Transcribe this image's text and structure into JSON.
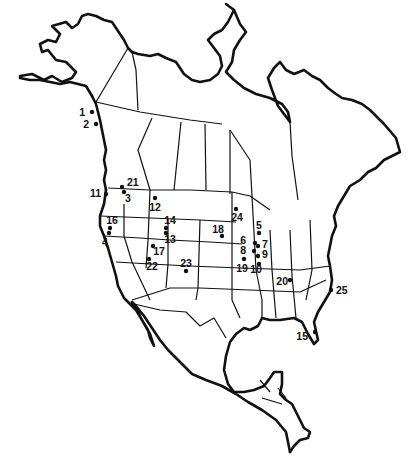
{
  "map": {
    "title": "",
    "region": "North America",
    "style": {
      "ink": "#111111",
      "background": "#ffffff"
    },
    "sites": [
      {
        "id": "1",
        "label": "1",
        "dot": [
          92,
          112
        ],
        "text": [
          85,
          116
        ],
        "anchor": "end"
      },
      {
        "id": "2",
        "label": "2",
        "dot": [
          96,
          124
        ],
        "text": [
          89,
          128
        ],
        "anchor": "end"
      },
      {
        "id": "3",
        "label": "3",
        "dot": [
          124,
          192
        ],
        "text": [
          125,
          202
        ],
        "anchor": "start"
      },
      {
        "id": "4",
        "label": "4",
        "dot": [
          109,
          233
        ],
        "text": [
          105,
          246
        ],
        "anchor": "middle"
      },
      {
        "id": "5",
        "label": "5",
        "dot": [
          259,
          233
        ],
        "text": [
          259,
          229
        ],
        "anchor": "middle"
      },
      {
        "id": "6",
        "label": "6",
        "dot": [
          255,
          243
        ],
        "text": [
          246,
          244
        ],
        "anchor": "end"
      },
      {
        "id": "7",
        "label": "7",
        "dot": [
          258,
          246
        ],
        "text": [
          262,
          248
        ],
        "anchor": "start"
      },
      {
        "id": "8",
        "label": "8",
        "dot": [
          254,
          251
        ],
        "text": [
          246,
          254
        ],
        "anchor": "end"
      },
      {
        "id": "9",
        "label": "9",
        "dot": [
          258,
          256
        ],
        "text": [
          262,
          258
        ],
        "anchor": "start"
      },
      {
        "id": "10",
        "label": "10",
        "dot": [
          259,
          264
        ],
        "text": [
          256,
          273
        ],
        "anchor": "middle"
      },
      {
        "id": "11",
        "label": "11",
        "dot": [
          106,
          194
        ],
        "text": [
          101,
          197
        ],
        "anchor": "end"
      },
      {
        "id": "12",
        "label": "12",
        "dot": [
          155,
          198
        ],
        "text": [
          155,
          211
        ],
        "anchor": "middle"
      },
      {
        "id": "13",
        "label": "13",
        "dot": [
          166,
          233
        ],
        "text": [
          170,
          243
        ],
        "anchor": "middle"
      },
      {
        "id": "14",
        "label": "14",
        "dot": [
          166,
          228
        ],
        "text": [
          170,
          224
        ],
        "anchor": "middle"
      },
      {
        "id": "15",
        "label": "15",
        "dot": [
          315,
          332
        ],
        "text": [
          308,
          340
        ],
        "anchor": "end"
      },
      {
        "id": "16",
        "label": "16",
        "dot": [
          110,
          228
        ],
        "text": [
          112,
          224
        ],
        "anchor": "middle"
      },
      {
        "id": "17",
        "label": "17",
        "dot": [
          153,
          246
        ],
        "text": [
          159,
          255
        ],
        "anchor": "middle"
      },
      {
        "id": "18",
        "label": "18",
        "dot": [
          222,
          236
        ],
        "text": [
          218,
          233
        ],
        "anchor": "middle"
      },
      {
        "id": "19",
        "label": "19",
        "dot": [
          244,
          259
        ],
        "text": [
          242,
          272
        ],
        "anchor": "middle"
      },
      {
        "id": "20",
        "label": "20",
        "dot": [
          290,
          280
        ],
        "text": [
          288,
          285
        ],
        "anchor": "end"
      },
      {
        "id": "21",
        "label": "21",
        "dot": [
          122,
          187
        ],
        "text": [
          127,
          186
        ],
        "anchor": "start"
      },
      {
        "id": "22",
        "label": "22",
        "dot": [
          149,
          259
        ],
        "text": [
          152,
          270
        ],
        "anchor": "middle"
      },
      {
        "id": "23",
        "label": "23",
        "dot": [
          186,
          271
        ],
        "text": [
          186,
          267
        ],
        "anchor": "middle"
      },
      {
        "id": "24",
        "label": "24",
        "dot": [
          236,
          209
        ],
        "text": [
          237,
          221
        ],
        "anchor": "middle"
      },
      {
        "id": "25",
        "label": "25",
        "dot": [
          331,
          290
        ],
        "text": [
          336,
          294
        ],
        "anchor": "start"
      }
    ]
  }
}
